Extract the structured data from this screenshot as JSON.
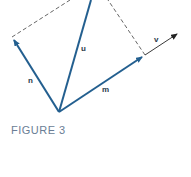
{
  "figure": {
    "caption": "FIGURE 3",
    "labels": {
      "u": "u",
      "n": "n",
      "m": "m",
      "v": "v"
    },
    "colors": {
      "vector": "#235f8f",
      "dashed": "#555555",
      "axis": "#333333",
      "caption": "#6a7d95"
    }
  }
}
